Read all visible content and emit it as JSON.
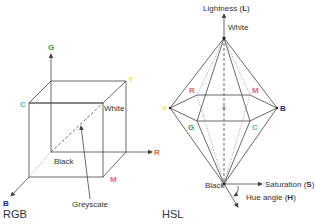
{
  "rgb": {
    "caption": "RGB",
    "axes": {
      "G": {
        "label": "G",
        "color": "#3a9a4a"
      },
      "R": {
        "label": "R",
        "color": "#e07030"
      },
      "B": {
        "label": "B",
        "color": "#2a2a7a"
      }
    },
    "corners": {
      "C": {
        "label": "C",
        "color": "#5ab0d8"
      },
      "Y": {
        "label": "Y",
        "color": "#e8e850"
      },
      "M": {
        "label": "M",
        "color": "#e06a8a"
      },
      "white": "White",
      "black": "Black"
    },
    "greyscale_label": "Greyscale"
  },
  "hsl": {
    "caption": "HSL",
    "lightness_label": "Lightness (",
    "lightness_symbol": "L",
    "saturation_label": "Saturation (",
    "saturation_symbol": "S",
    "hue_label": "Hue angle (",
    "hue_symbol": "H",
    "close_paren": ")",
    "white": "White",
    "black": "Black",
    "vertices": {
      "Y": {
        "label": "Y",
        "color": "#e8e850"
      },
      "R": {
        "label": "R",
        "color": "#e07050"
      },
      "M": {
        "label": "M",
        "color": "#e06a8a"
      },
      "B": {
        "label": "B",
        "color": "#2a2a7a"
      },
      "G": {
        "label": "G",
        "color": "#3a9a4a"
      },
      "C": {
        "label": "C",
        "color": "#5ab0d8"
      }
    }
  }
}
